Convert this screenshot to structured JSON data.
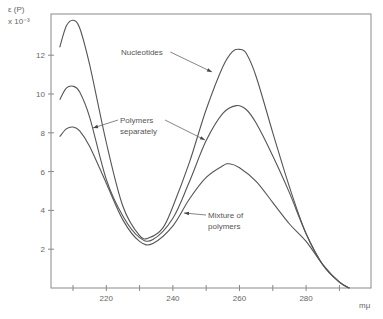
{
  "chart_data": {
    "type": "line",
    "title": "",
    "ylabel": "ε (P)",
    "ylabel_scale": "x 10⁻³",
    "xlabel": "mμ",
    "xlim": [
      205,
      297
    ],
    "ylim": [
      0,
      14.1
    ],
    "grid": false,
    "legend": "none (inline annotations with arrows)",
    "x_ticks": [
      210,
      220,
      230,
      240,
      250,
      260,
      270,
      280,
      290
    ],
    "x_tick_labels": [
      "",
      "220",
      "",
      "240",
      "",
      "260",
      "",
      "280",
      ""
    ],
    "y_ticks": [
      2,
      4,
      6,
      8,
      10,
      12
    ],
    "y_tick_labels": [
      "2",
      "4",
      "6",
      "8",
      "10",
      "12"
    ],
    "series": [
      {
        "name": "Nucleotides",
        "points": [
          [
            206,
            12.4
          ],
          [
            208,
            13.5
          ],
          [
            210,
            13.8
          ],
          [
            212,
            13.4
          ],
          [
            215,
            11.5
          ],
          [
            220,
            7.5
          ],
          [
            225,
            4.2
          ],
          [
            230,
            2.7
          ],
          [
            233,
            2.6
          ],
          [
            237,
            3.1
          ],
          [
            240,
            4.2
          ],
          [
            245,
            6.5
          ],
          [
            250,
            9.2
          ],
          [
            255,
            11.4
          ],
          [
            258,
            12.2
          ],
          [
            260,
            12.3
          ],
          [
            262,
            12.1
          ],
          [
            265,
            10.9
          ],
          [
            270,
            8.0
          ],
          [
            275,
            5.2
          ],
          [
            280,
            2.8
          ],
          [
            285,
            1.2
          ],
          [
            290,
            0.3
          ],
          [
            293,
            0
          ]
        ]
      },
      {
        "name": "Polymers separately",
        "points": [
          [
            206,
            9.7
          ],
          [
            208,
            10.3
          ],
          [
            210,
            10.4
          ],
          [
            212,
            10.1
          ],
          [
            215,
            8.8
          ],
          [
            220,
            5.6
          ],
          [
            225,
            3.7
          ],
          [
            230,
            2.6
          ],
          [
            234,
            2.5
          ],
          [
            240,
            3.6
          ],
          [
            245,
            5.5
          ],
          [
            250,
            7.6
          ],
          [
            255,
            9.0
          ],
          [
            259,
            9.4
          ],
          [
            262,
            9.2
          ],
          [
            265,
            8.5
          ],
          [
            270,
            6.8
          ],
          [
            275,
            4.9
          ],
          [
            280,
            2.8
          ],
          [
            285,
            1.2
          ],
          [
            290,
            0.3
          ],
          [
            293,
            0
          ]
        ]
      },
      {
        "name": "Mixture of polymers",
        "points": [
          [
            206,
            7.8
          ],
          [
            208,
            8.2
          ],
          [
            210,
            8.3
          ],
          [
            212,
            8.1
          ],
          [
            215,
            7.3
          ],
          [
            220,
            5.4
          ],
          [
            225,
            3.5
          ],
          [
            230,
            2.4
          ],
          [
            234,
            2.3
          ],
          [
            240,
            3.2
          ],
          [
            245,
            4.6
          ],
          [
            250,
            5.7
          ],
          [
            255,
            6.3
          ],
          [
            257,
            6.4
          ],
          [
            260,
            6.2
          ],
          [
            265,
            5.5
          ],
          [
            270,
            4.4
          ],
          [
            275,
            3.3
          ],
          [
            280,
            2.4
          ],
          [
            285,
            1.2
          ],
          [
            290,
            0.3
          ],
          [
            293,
            0
          ]
        ]
      }
    ],
    "annotations": [
      {
        "text_lines": [
          "Nucleotides"
        ],
        "pos": [
          121,
          55
        ],
        "arrows_to": [
          [
            212,
            72
          ]
        ]
      },
      {
        "text_lines": [
          "Polymers",
          "separately"
        ],
        "pos": [
          120,
          123
        ],
        "arrows_to": [
          [
            93,
            128
          ],
          [
            205,
            140
          ]
        ]
      },
      {
        "text_lines": [
          "Mixture of",
          "polymers"
        ],
        "pos": [
          208,
          218
        ],
        "arrows_to": [
          [
            184,
            213
          ]
        ]
      }
    ]
  },
  "labels": {
    "y_axis_title": "ε (P)",
    "y_axis_scale": "x 10⁻³",
    "x_axis_unit": "mμ"
  }
}
